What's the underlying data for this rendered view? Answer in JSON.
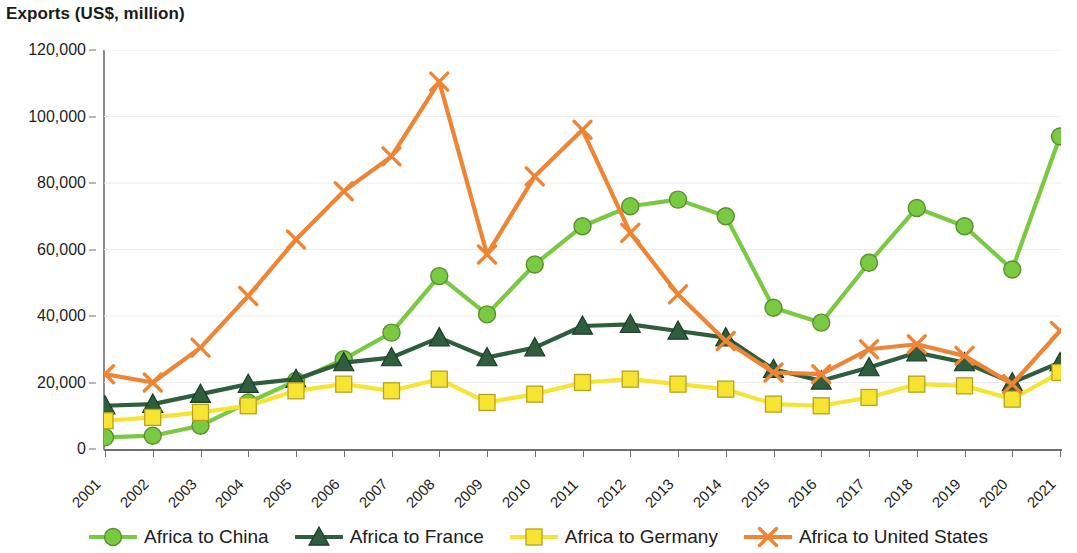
{
  "chart_data": {
    "type": "line",
    "title": "Exports (US$, million)",
    "xlabel": "",
    "ylabel": "",
    "ylim": [
      0,
      120000
    ],
    "ytick_labels": [
      "0",
      "20,000",
      "40,000",
      "60,000",
      "80,000",
      "100,000",
      "120,000"
    ],
    "yticks": [
      0,
      20000,
      40000,
      60000,
      80000,
      100000,
      120000
    ],
    "grid": true,
    "legend_position": "bottom",
    "categories": [
      "2001",
      "2002",
      "2003",
      "2004",
      "2005",
      "2006",
      "2007",
      "2008",
      "2009",
      "2010",
      "2011",
      "2012",
      "2013",
      "2014",
      "2015",
      "2016",
      "2017",
      "2018",
      "2019",
      "2020",
      "2021"
    ],
    "series": [
      {
        "name": "Africa to China",
        "color": "#7AC943",
        "marker": "circle",
        "values": [
          3500,
          4000,
          7000,
          14000,
          20500,
          27000,
          35000,
          52000,
          40500,
          55500,
          67000,
          73000,
          75000,
          70000,
          42500,
          38000,
          56000,
          72500,
          67000,
          54000,
          94000
        ]
      },
      {
        "name": "Africa to France",
        "color": "#2E5E3E",
        "marker": "triangle",
        "values": [
          13000,
          13500,
          16500,
          19500,
          21000,
          26000,
          27500,
          33500,
          27500,
          30500,
          37000,
          37500,
          35500,
          33500,
          24000,
          20500,
          24500,
          29000,
          26000,
          20000,
          26000
        ]
      },
      {
        "name": "Africa to Germany",
        "color": "#F7E432",
        "marker": "square",
        "values": [
          8500,
          9500,
          11000,
          13000,
          17500,
          19500,
          17500,
          21000,
          14000,
          16500,
          20000,
          21000,
          19500,
          18000,
          13500,
          13000,
          15500,
          19500,
          19000,
          15000,
          23000
        ]
      },
      {
        "name": "Africa to United States",
        "color": "#EE8534",
        "marker": "x",
        "values": [
          22500,
          20000,
          30500,
          46000,
          63000,
          77500,
          88000,
          110500,
          58500,
          82000,
          96000,
          65000,
          46500,
          32500,
          23000,
          22500,
          30000,
          31500,
          28000,
          19500,
          35500
        ]
      }
    ]
  }
}
